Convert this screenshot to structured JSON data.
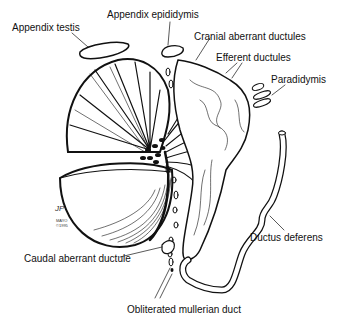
{
  "diagram": {
    "labels": {
      "appendix_testis": "Appendix testis",
      "appendix_epididymis": "Appendix epididymis",
      "cranial_aberrant_ductules": "Cranial aberrant ductules",
      "efferent_ductules": "Efferent ductules",
      "paradidymis": "Paradidymis",
      "ductus_deferens": "Ductus deferens",
      "caudal_aberrant_ductule": "Caudal aberrant ductule",
      "obliterated_mullerian_duct": "Obliterated mullerian duct"
    },
    "signature": {
      "initials": "JP",
      "org": "MAYO",
      "year": "©1995"
    },
    "colors": {
      "ink": "#111111",
      "paper": "#ffffff"
    }
  }
}
